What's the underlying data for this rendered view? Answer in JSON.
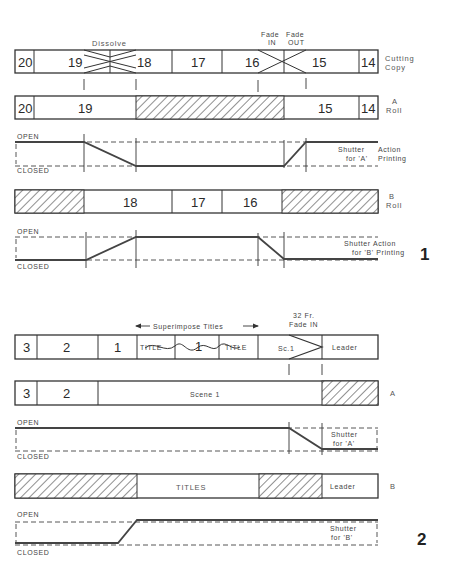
{
  "figure1": {
    "number": "1",
    "cutting_copy": {
      "label_line1": "Cutting",
      "label_line2": "Copy",
      "segments": [
        "20",
        "19",
        "18",
        "17",
        "16",
        "15",
        "14"
      ],
      "dissolve_label": "Dissolve",
      "fade_in_label_line1": "Fade",
      "fade_in_label_line2": "IN",
      "fade_out_label_line1": "Fade",
      "fade_out_label_line2": "OUT"
    },
    "a_roll": {
      "label_line1": "A",
      "label_line2": "Roll",
      "segments": [
        "20",
        "19",
        "15",
        "14"
      ]
    },
    "shutter_a": {
      "open_label": "OPEN",
      "closed_label": "CLOSED",
      "caption_line1": "Shutter",
      "caption_line2": "for 'A'",
      "caption_line3": "Action",
      "caption_line4": "Printing"
    },
    "b_roll": {
      "label_line1": "B",
      "label_line2": "Roll",
      "segments": [
        "18",
        "17",
        "16"
      ]
    },
    "shutter_b": {
      "open_label": "OPEN",
      "closed_label": "CLOSED",
      "caption_line1": "Shutter Action",
      "caption_line2": "for 'B' Printing"
    }
  },
  "figure2": {
    "number": "2",
    "cutting_copy": {
      "segments": [
        "3",
        "2",
        "1",
        "TITLE",
        "1",
        "TITLE",
        "Sc.1",
        "Leader"
      ],
      "superimpose_label": "Superimpose Titles",
      "fade_label_line1": "32 Fr.",
      "fade_label_line2": "Fade IN"
    },
    "a_roll": {
      "label": "A",
      "segments": [
        "3",
        "2",
        "Scene 1"
      ]
    },
    "shutter_a": {
      "open_label": "OPEN",
      "closed_label": "CLOSED",
      "caption_line1": "Shutter",
      "caption_line2": "for 'A'"
    },
    "b_roll": {
      "label": "B",
      "segments": [
        "TITLES",
        "Leader"
      ]
    },
    "shutter_b": {
      "open_label": "OPEN",
      "closed_label": "CLOSED",
      "caption_line1": "Shutter",
      "caption_line2": "for 'B'"
    }
  }
}
